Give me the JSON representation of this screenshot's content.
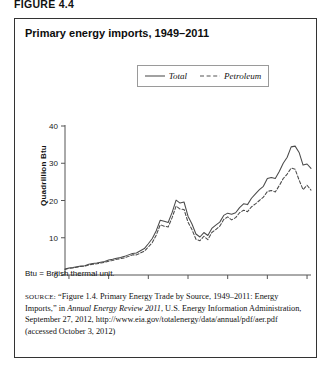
{
  "figure_label": "FIGURE 4.4",
  "title": "Primary energy imports, 1949–2011",
  "legend": {
    "items": [
      {
        "label": "Total",
        "style": "solid"
      },
      {
        "label": "Petroleum",
        "style": "dashed"
      }
    ]
  },
  "notes": {
    "btu": "Btu = British thermal unit."
  },
  "source": {
    "prefix": "SOURCE:",
    "part1": " “Figure 1.4. Primary Energy Trade by Source, 1949–2011: Energy Imports,” in ",
    "italic": "Annual Energy Review 2011",
    "part2": ", U.S. Energy Information Administration, September 27, 2012, http://www.eia.gov/totalenergy/data/annual/pdf/aer.pdf (accessed October 3, 2012)"
  },
  "chart_data": {
    "type": "line",
    "title": "Primary energy imports, 1949–2011",
    "xlabel": "",
    "ylabel": "Quadrillion Btu",
    "xlim": [
      1949,
      2011
    ],
    "ylim": [
      0,
      40
    ],
    "yticks": [
      0,
      10,
      20,
      30,
      40
    ],
    "xticks": [
      1950,
      1960,
      1970,
      1980,
      1990,
      2000,
      2010
    ],
    "grid": false,
    "legend_position": "top-center",
    "x": [
      1949,
      1950,
      1951,
      1952,
      1953,
      1954,
      1955,
      1956,
      1957,
      1958,
      1959,
      1960,
      1961,
      1962,
      1963,
      1964,
      1965,
      1966,
      1967,
      1968,
      1969,
      1970,
      1971,
      1972,
      1973,
      1974,
      1975,
      1976,
      1977,
      1978,
      1979,
      1980,
      1981,
      1982,
      1983,
      1984,
      1985,
      1986,
      1987,
      1988,
      1989,
      1990,
      1991,
      1992,
      1993,
      1994,
      1995,
      1996,
      1997,
      1998,
      1999,
      2000,
      2001,
      2002,
      2003,
      2004,
      2005,
      2006,
      2007,
      2008,
      2009,
      2010,
      2011
    ],
    "series": [
      {
        "name": "Total",
        "style": "solid",
        "values": [
          1.6,
          1.9,
          2.0,
          2.2,
          2.4,
          2.5,
          2.9,
          3.1,
          3.2,
          3.4,
          3.6,
          4.0,
          4.2,
          4.5,
          4.7,
          5.0,
          5.4,
          5.8,
          5.9,
          6.5,
          7.1,
          8.4,
          9.8,
          11.9,
          14.7,
          14.4,
          14.1,
          16.8,
          20.1,
          19.3,
          19.6,
          15.8,
          13.7,
          11.0,
          10.2,
          11.4,
          10.6,
          12.5,
          13.4,
          14.2,
          16.0,
          16.6,
          16.3,
          16.7,
          18.1,
          19.1,
          18.9,
          20.6,
          21.8,
          22.9,
          23.8,
          25.9,
          26.2,
          25.9,
          27.8,
          30.0,
          31.6,
          34.4,
          34.6,
          32.9,
          29.5,
          29.8,
          28.6
        ]
      },
      {
        "name": "Petroleum",
        "style": "dashed",
        "values": [
          1.5,
          1.8,
          1.9,
          2.1,
          2.3,
          2.4,
          2.7,
          2.9,
          3.0,
          3.2,
          3.4,
          3.7,
          3.9,
          4.2,
          4.4,
          4.6,
          5.0,
          5.4,
          5.4,
          5.9,
          6.4,
          7.5,
          8.7,
          10.7,
          13.5,
          13.1,
          12.9,
          15.4,
          18.5,
          17.7,
          17.6,
          14.2,
          12.2,
          9.6,
          9.2,
          10.4,
          9.5,
          11.4,
          12.2,
          13.1,
          14.9,
          15.6,
          14.8,
          15.4,
          16.7,
          17.4,
          17.0,
          18.3,
          19.1,
          20.0,
          20.9,
          22.4,
          22.7,
          22.3,
          24.0,
          25.9,
          27.1,
          28.7,
          28.4,
          25.5,
          22.9,
          24.1,
          22.8
        ]
      }
    ]
  }
}
